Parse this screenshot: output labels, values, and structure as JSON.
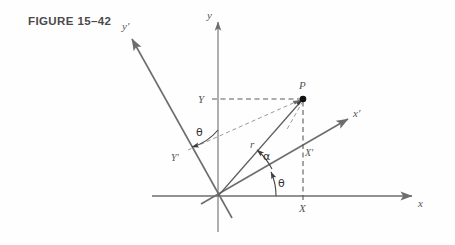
{
  "figure": {
    "caption": "FIGURE 15–42",
    "type": "coordinate-rotation-diagram"
  },
  "labels": {
    "axis_y": "y",
    "axis_x": "x",
    "axis_y_prime": "y′",
    "axis_x_prime": "x′",
    "point_p": "P",
    "coord_Y": "Y",
    "coord_X": "X",
    "coord_Y_prime": "Y′",
    "coord_X_prime": "X′",
    "radius_r": "r",
    "angle_alpha": "α",
    "angle_theta_origin": "θ",
    "angle_theta_upper": "θ"
  },
  "colors": {
    "caption": "#4a4a4a",
    "axis": "#6d6d6d",
    "ray": "#5d5d5d",
    "dash": "#5a5a5a",
    "dash_light": "#9a9a9a",
    "point": "#111111",
    "background": "#fefefe"
  },
  "geometry": {
    "origin": {
      "x": 218,
      "y": 196
    },
    "point_p": {
      "x": 303,
      "y": 99
    },
    "rotation_angle_deg": 25,
    "notes": "Rotated frame x′y′ at angle theta from xy frame; P has polar radius r at angle alpha from x′ axis"
  }
}
